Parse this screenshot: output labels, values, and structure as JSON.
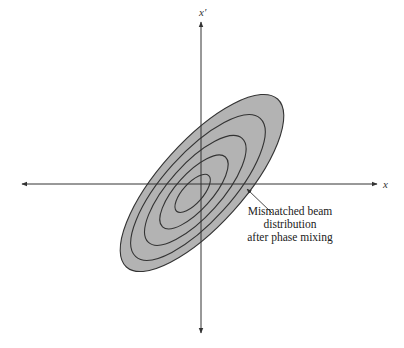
{
  "diagram": {
    "type": "phase-space ellipse diagram",
    "axes": {
      "horizontal_label": "x",
      "vertical_label": "x′"
    },
    "distribution": {
      "contour_count": 5,
      "fill_color": "#b3b3b3",
      "line_color": "#333333"
    },
    "annotation": {
      "lines": [
        "Mismatched beam",
        "distribution",
        "after phase mixing"
      ]
    }
  }
}
